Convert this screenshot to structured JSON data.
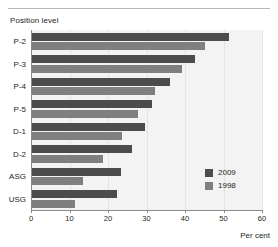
{
  "chart_data": {
    "type": "bar",
    "orientation": "horizontal",
    "title": "",
    "ylabel": "Position level",
    "xlabel": "Per cent",
    "categories": [
      "P-2",
      "P-3",
      "P-4",
      "P-5",
      "D-1",
      "D-2",
      "ASG",
      "USG"
    ],
    "series": [
      {
        "name": "2009",
        "color": "#4c4c4c",
        "values": [
          51.5,
          42.6,
          36.1,
          31.4,
          29.6,
          26.2,
          23.4,
          22.3
        ]
      },
      {
        "name": "1998",
        "color": "#7f7f7f",
        "values": [
          45.2,
          39.2,
          32.2,
          27.8,
          23.6,
          18.7,
          13.5,
          11.4
        ]
      }
    ],
    "xlim": [
      0,
      60
    ],
    "xticks": [
      0,
      10,
      20,
      30,
      40,
      50,
      60
    ],
    "xtick_labels": [
      "0",
      "10",
      "20",
      "30",
      "40",
      "50",
      "60"
    ],
    "grid": true,
    "legend_position": "bottom-right"
  },
  "legend": {
    "entries": [
      {
        "label": "2009",
        "swatch": "#4c4c4c"
      },
      {
        "label": "1998",
        "swatch": "#7f7f7f"
      }
    ]
  }
}
